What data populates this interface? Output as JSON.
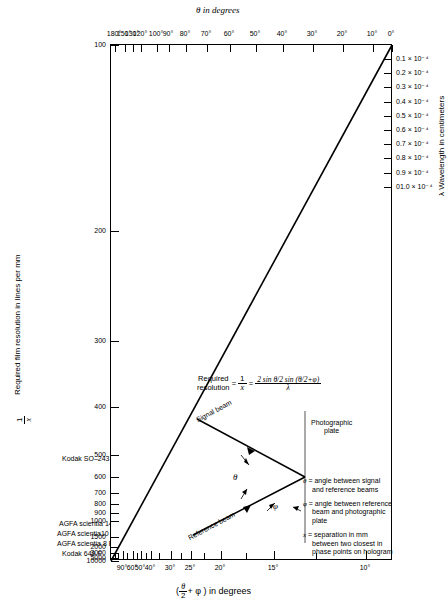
{
  "chart_data": {
    "type": "line",
    "xlabel": "( θ/2 + φ ) in degrees",
    "ylabel": "1/x  Required film resolution in lines per mm",
    "top_axis_label": "θ  in degrees",
    "right_axis_label": "λ  Wavelength in centimeters",
    "grid": false,
    "legend_position": "none",
    "y_scale": "log-like",
    "ylim": [
      100,
      10000
    ],
    "top_ticks": [
      "180°",
      "150°",
      "130°",
      "120°",
      "100°",
      "90°",
      "80°",
      "70°",
      "60°",
      "50°",
      "40°",
      "30°",
      "20°",
      "10°",
      "0°"
    ],
    "bottom_ticks": [
      "90°",
      "60°",
      "50°",
      "40°",
      "30°",
      "25°",
      "20°",
      "15°",
      "10°"
    ],
    "left_ticks": [
      "100",
      "200",
      "300",
      "400",
      "500",
      "600",
      "700",
      "800",
      "900",
      "1000",
      "1500",
      "2000",
      "3000",
      "5000",
      "10000"
    ],
    "right_ticks": [
      "0.1 × 10⁻⁴",
      "0.2 × 10⁻⁴",
      "0.3 × 10⁻⁴",
      "0.4 × 10⁻⁴",
      "0.5 × 10⁻⁴",
      "0.6 × 10⁻⁴",
      "0.7 × 10⁻⁴",
      "0.8 × 10⁻⁴",
      "0.9 × 10⁻⁴",
      "01.0 × 10⁻⁴"
    ],
    "series": [
      {
        "name": "required resolution",
        "x": [
          0,
          100
        ],
        "y": [
          10000,
          100
        ],
        "description": "single straight diagonal line from lower-left (10000 lines/mm) to upper-right (100 lines/mm at 0°)"
      }
    ],
    "film_annotations": [
      {
        "label": "Kodak SO-243",
        "value": "500"
      },
      {
        "label": "AGFA scientia 14 C 70",
        "value": "1500"
      },
      {
        "label": "AGFA scientia 10 E 70, 10 E 75",
        "value": "2000"
      },
      {
        "label": "AGFA scientia 8 E 70, 8 E 75",
        "value": "3000"
      },
      {
        "label": "Kodak 649 F",
        "value": "5000"
      }
    ]
  },
  "axes": {
    "top_title": "θ  in degrees",
    "top_ticks": [
      "180°",
      "150°",
      "130°",
      "120°",
      "100°",
      "90°",
      "80°",
      "70°",
      "60°",
      "50°",
      "40°",
      "30°",
      "20°",
      "10°",
      "0°"
    ],
    "bottom_ticks": [
      "90°",
      "60°",
      "50°",
      "40°",
      "30°",
      "25°",
      "20°",
      "15°",
      "10°"
    ],
    "bottom_title_open": "(",
    "bottom_title_num": "θ",
    "bottom_title_den": "2",
    "bottom_title_plus": "+ φ )",
    "bottom_title_tail": " in degrees",
    "left_title_sym_num": "1",
    "left_title_sym_den": "x",
    "left_title": "Required film resolution in lines per mm",
    "left_ticks": [
      "100",
      "200",
      "300",
      "400",
      "500",
      "600",
      "700",
      "800",
      "900",
      "1000",
      "1500",
      "2000",
      "3000",
      "5000",
      "10000"
    ],
    "right_title": "λ  Wavelength in centimeters",
    "right_ticks": [
      "0.1 × 10⁻⁴",
      "0.2 × 10⁻⁴",
      "0.3 × 10⁻⁴",
      "0.4 × 10⁻⁴",
      "0.5 × 10⁻⁴",
      "0.6 × 10⁻⁴",
      "0.7 × 10⁻⁴",
      "0.8 × 10⁻⁴",
      "0.9 × 10⁻⁴",
      "01.0 × 10⁻⁴"
    ]
  },
  "film_labels": {
    "kodak_so243": "Kodak SO–243",
    "agfa_14c70": "AGFA scientia 14 C 70",
    "agfa_10e70": "AGFA scientia10 E 70,  10 E 75",
    "agfa_8e70": "AGFA scientia 8 E 70,  8 E 75",
    "kodak_649f": "Kodak  649 F"
  },
  "formula": {
    "lhs_line1": "Required",
    "lhs_line2": "resolution",
    "eq1": "=",
    "lhs_frac_num": "1",
    "lhs_frac_den": "x",
    "eq2": "=",
    "rhs_num": "2 sin θ/2 sin (θ/2+φ)",
    "rhs_den": "λ"
  },
  "diagram": {
    "signal_beam": "Signal beam",
    "reference_beam": "Reference beam",
    "photographic_plate_l1": "Photographic",
    "photographic_plate_l2": "plate",
    "theta_symbol": "θ",
    "phi_symbol": "φ"
  },
  "var_legend": [
    {
      "symbol": "θ",
      "eq": "=",
      "text": "angle between signal and reference beams"
    },
    {
      "symbol": "φ",
      "eq": "=",
      "text": "angle between reference beam and photographic plate"
    },
    {
      "symbol": "x",
      "eq": "=",
      "text": "separation in mm between two closest in phase points on hologram"
    }
  ]
}
